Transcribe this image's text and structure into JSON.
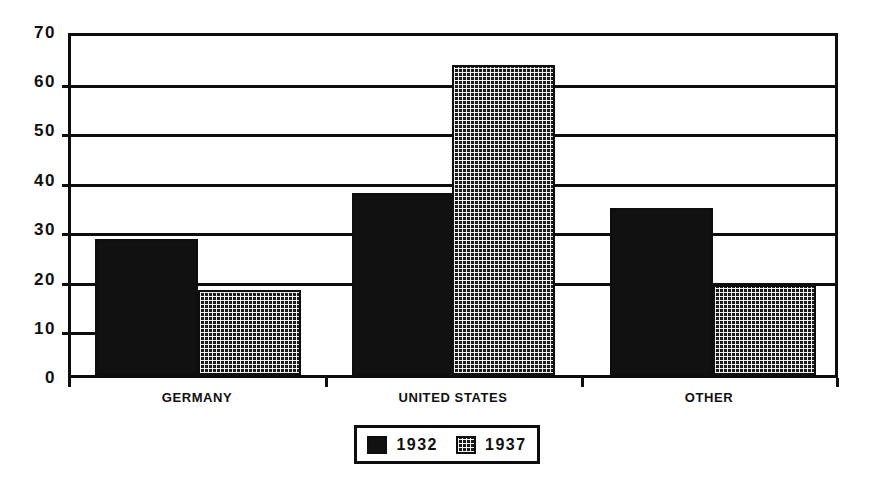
{
  "chart_data": {
    "type": "bar",
    "title": "",
    "subtitle": "",
    "xlabel": "",
    "ylabel": "",
    "categories": [
      "GERMANY",
      "UNITED STATES",
      "OTHER"
    ],
    "series": [
      {
        "name": "1932",
        "values": [
          28,
          37.5,
          34.5
        ],
        "fill": "solid-black",
        "color": "#111111"
      },
      {
        "name": "1937",
        "values": [
          17.5,
          64,
          18.5
        ],
        "fill": "dotted-checker",
        "color": "#1a1a1a"
      }
    ],
    "ylim": [
      0,
      70
    ],
    "ytick_labels": [
      "0",
      "10",
      "20",
      "30",
      "40",
      "50",
      "60",
      "70"
    ],
    "ytick_values": [
      0,
      10,
      20,
      30,
      40,
      50,
      60,
      70
    ],
    "gridlines": true,
    "gridline_values": [
      20,
      30,
      40,
      50,
      60
    ],
    "short_gridline_values": [
      10,
      20
    ],
    "legend": {
      "position": "bottom",
      "entries": [
        {
          "label": "1932",
          "swatch": "solid-black-swatch"
        },
        {
          "label": "1937",
          "swatch": "dotted-checker-swatch"
        }
      ]
    },
    "axis_color": "#0d0d0d",
    "background": "#ffffff"
  }
}
